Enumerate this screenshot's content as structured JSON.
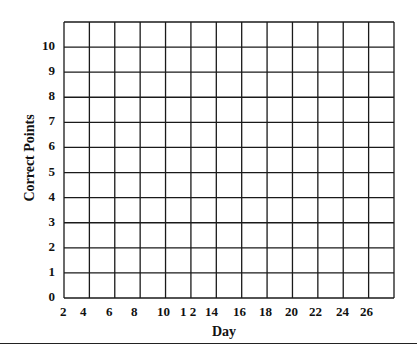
{
  "chart_data": {
    "type": "line",
    "title": "",
    "xlabel": "Day",
    "ylabel": "Correct Points",
    "x_tick_labels": [
      "2",
      "4",
      "6",
      "8",
      "10",
      "1 2",
      "14",
      "16",
      "18",
      "20",
      "22",
      "24",
      "26"
    ],
    "y_tick_labels": [
      "0",
      "1",
      "2",
      "3",
      "4",
      "5",
      "6",
      "7",
      "8",
      "9",
      "10"
    ],
    "ylim": [
      0,
      11
    ],
    "grid": true,
    "series": [],
    "columns": 13,
    "rows": 11
  }
}
